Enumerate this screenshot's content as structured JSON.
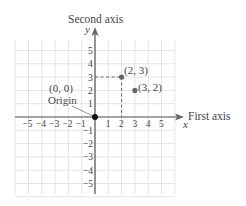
{
  "axes": {
    "y_axis_title": "Second axis",
    "y_axis_var": "y",
    "x_axis_title": "First axis",
    "x_axis_var": "x",
    "x_ticks": [
      "−5",
      "−4",
      "−3",
      "−2",
      "−1",
      "1",
      "2",
      "3",
      "4",
      "5"
    ],
    "y_ticks_pos": [
      "1",
      "2",
      "3",
      "4",
      "5"
    ],
    "y_ticks_neg": [
      "−1",
      "−2",
      "−3",
      "−4",
      "−5"
    ]
  },
  "points": [
    {
      "label": "(2, 3)",
      "x": 2,
      "y": 3,
      "dashed_guides": true
    },
    {
      "label": "(3, 2)",
      "x": 3,
      "y": 2,
      "dashed_guides": false
    }
  ],
  "origin": {
    "coord_label": "(0, 0)",
    "name_label": "Origin"
  },
  "colors": {
    "grid": "#e4e4e4",
    "axis": "#555555",
    "point_gray": "#666666",
    "origin_point": "#111111",
    "text": "#444444",
    "guide": "#666666"
  },
  "chart_data": {
    "type": "scatter",
    "title": "",
    "xlabel": "First axis (x)",
    "ylabel": "Second axis (y)",
    "xlim": [
      -6,
      6
    ],
    "ylim": [
      -6,
      6
    ],
    "grid": true,
    "series": [
      {
        "name": "points",
        "x": [
          0,
          2,
          3
        ],
        "y": [
          0,
          3,
          2
        ],
        "labels": [
          "(0, 0) Origin",
          "(2, 3)",
          "(3, 2)"
        ]
      }
    ]
  }
}
